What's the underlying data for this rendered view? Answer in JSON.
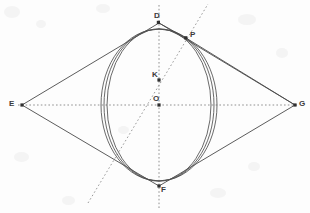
{
  "figure": {
    "type": "geometry-diagram",
    "width": 310,
    "height": 213,
    "background_color": "#fdfdfd",
    "stroke_color": "#4a4a4a",
    "dotted_color": "#8e8e8e",
    "label_color": "#3b3b3b"
  },
  "points": {
    "D": {
      "label": "D",
      "x": 159,
      "y": 23,
      "label_x": 154,
      "label_y": 12
    },
    "P": {
      "label": "P",
      "x": 186,
      "y": 38,
      "label_x": 190,
      "label_y": 31
    },
    "K": {
      "label": "K",
      "x": 159,
      "y": 80,
      "label_x": 152,
      "label_y": 71
    },
    "O": {
      "label": "O",
      "x": 159,
      "y": 105,
      "label_x": 153,
      "label_y": 95
    },
    "E": {
      "label": "E",
      "x": 22,
      "y": 105,
      "label_x": 9,
      "label_y": 100
    },
    "G": {
      "label": "G",
      "x": 295,
      "y": 105,
      "label_x": 299,
      "label_y": 100
    },
    "F": {
      "label": "F",
      "x": 159,
      "y": 186,
      "label_x": 161,
      "label_y": 186
    }
  },
  "rhombus": {
    "name": "E-D-G-F",
    "vertices": [
      "E",
      "D",
      "G",
      "F"
    ],
    "path": "M 22 105 L 159 23 L 295 105 L 159 186 Z"
  },
  "ellipses": [
    {
      "name": "ellipse-inner",
      "cx": 159,
      "cy": 105,
      "rx": 52,
      "ry": 76
    },
    {
      "name": "ellipse-middle",
      "cx": 159,
      "cy": 105,
      "rx": 55,
      "ry": 76
    },
    {
      "name": "ellipse-outer",
      "cx": 159,
      "cy": 105,
      "rx": 58,
      "ry": 76
    }
  ],
  "axes": {
    "vertical": {
      "name": "axis-DF",
      "x1": 159,
      "y1": 5,
      "x2": 159,
      "y2": 210,
      "style": "dotted"
    },
    "horizontal": {
      "name": "axis-EG",
      "x1": 18,
      "y1": 105,
      "x2": 299,
      "y2": 105,
      "style": "dotted"
    },
    "diagonal": {
      "name": "axis-KP",
      "x1": 88,
      "y1": 203,
      "x2": 208,
      "y2": 4,
      "style": "dotted"
    }
  },
  "tangents": [
    {
      "name": "tangent-P-to-E-side",
      "x1": 186,
      "y1": 38,
      "x2": 159,
      "y2": 23
    },
    {
      "name": "tangent-P-to-G-side",
      "x1": 186,
      "y1": 38,
      "x2": 295,
      "y2": 105
    }
  ]
}
